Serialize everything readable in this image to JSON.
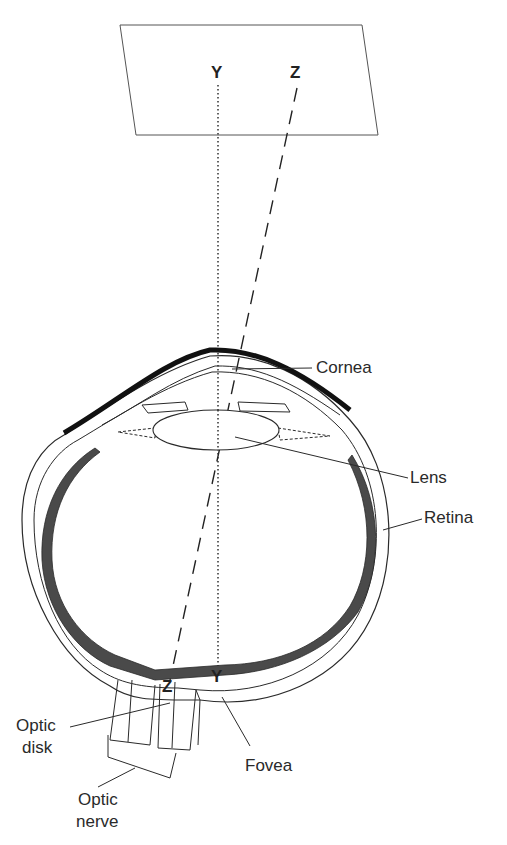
{
  "figure": {
    "type": "eye-cross-section",
    "plane_points": {
      "y": "Y",
      "z": "Z"
    },
    "retina_points": {
      "y": "Y",
      "z": "Z"
    }
  },
  "labels": {
    "cornea": "Cornea",
    "lens": "Lens",
    "retina": "Retina",
    "optic_disk_1": "Optic",
    "optic_disk_2": "disk",
    "fovea": "Fovea",
    "optic_nerve_1": "Optic",
    "optic_nerve_2": "nerve"
  },
  "colors": {
    "line": "#2a2a2a",
    "retina_fill": "#4a4a4a",
    "background": "#ffffff"
  }
}
